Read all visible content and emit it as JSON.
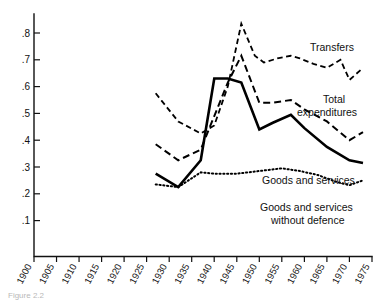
{
  "figure": {
    "caption": "Figure 2.2",
    "background_color": "#ffffff",
    "ink_color": "#000000"
  },
  "chart_data": {
    "type": "line",
    "title": "",
    "subtitle": "",
    "xlabel": "",
    "ylabel": "",
    "xlim": [
      1900,
      1977
    ],
    "ylim": [
      0.05,
      0.87
    ],
    "grid": false,
    "legend_position": "inline-right-annotations",
    "x_tick_labels": [
      "1900",
      "1905",
      "1910",
      "1915",
      "1920",
      "1925",
      "1930",
      "1935",
      "1940",
      "1945",
      "1950",
      "1955",
      "1960",
      "1965",
      "1970",
      "1975"
    ],
    "x_tick_values": [
      1900,
      1905,
      1910,
      1915,
      1920,
      1925,
      1930,
      1935,
      1940,
      1945,
      1950,
      1955,
      1960,
      1965,
      1970,
      1975
    ],
    "y_tick_labels": [
      ".1",
      ".2",
      ".3",
      ".4",
      ".5",
      ".6",
      ".7",
      ".8"
    ],
    "y_tick_values": [
      0.1,
      0.2,
      0.3,
      0.4,
      0.5,
      0.6,
      0.7,
      0.8
    ],
    "series": [
      {
        "name": "Transfers",
        "label": "Transfers",
        "style": "dashed",
        "x": [
          1927,
          1932,
          1937,
          1940,
          1943,
          1946,
          1949,
          1951,
          1954,
          1957,
          1959,
          1962,
          1965,
          1968,
          1970,
          1973
        ],
        "values": [
          0.575,
          0.47,
          0.425,
          0.455,
          0.6,
          0.835,
          0.715,
          0.69,
          0.705,
          0.715,
          0.705,
          0.685,
          0.67,
          0.7,
          0.625,
          0.67
        ]
      },
      {
        "name": "Total expenditures",
        "label": "Total expenditures",
        "style": "dashed",
        "x": [
          1927,
          1932,
          1937,
          1940,
          1943,
          1946,
          1950,
          1953,
          1957,
          1960,
          1965,
          1970,
          1973
        ],
        "values": [
          0.385,
          0.325,
          0.365,
          0.49,
          0.615,
          0.715,
          0.54,
          0.54,
          0.55,
          0.515,
          0.47,
          0.4,
          0.43
        ]
      },
      {
        "name": "Goods and services",
        "label": "Goods and services",
        "style": "solid",
        "x": [
          1927,
          1932,
          1937,
          1940,
          1943,
          1946,
          1950,
          1953,
          1957,
          1960,
          1965,
          1970,
          1973
        ],
        "values": [
          0.275,
          0.225,
          0.325,
          0.63,
          0.63,
          0.615,
          0.44,
          0.465,
          0.495,
          0.445,
          0.375,
          0.325,
          0.315
        ]
      },
      {
        "name": "Goods and services without defence",
        "label": "Goods and services without defence",
        "label_line1": "Goods and services",
        "label_line2": "without defence",
        "style": "dotted",
        "x": [
          1927,
          1932,
          1937,
          1940,
          1945,
          1950,
          1955,
          1959,
          1963,
          1967,
          1970,
          1973
        ],
        "values": [
          0.235,
          0.225,
          0.28,
          0.275,
          0.275,
          0.285,
          0.295,
          0.285,
          0.27,
          0.245,
          0.232,
          0.25
        ]
      }
    ],
    "annotations": [
      {
        "text": "Transfers",
        "x": 1966,
        "y": 0.735
      },
      {
        "text": "Total",
        "x": 1967,
        "y": 0.545
      },
      {
        "text": "expenditures",
        "x": 1962,
        "y": 0.505
      },
      {
        "text": "Goods and services",
        "x": 1956,
        "y": 0.29
      },
      {
        "text": "Goods and services",
        "x": 1956,
        "y": 0.215
      },
      {
        "text": "without defence",
        "x": 1960,
        "y": 0.185
      }
    ]
  }
}
